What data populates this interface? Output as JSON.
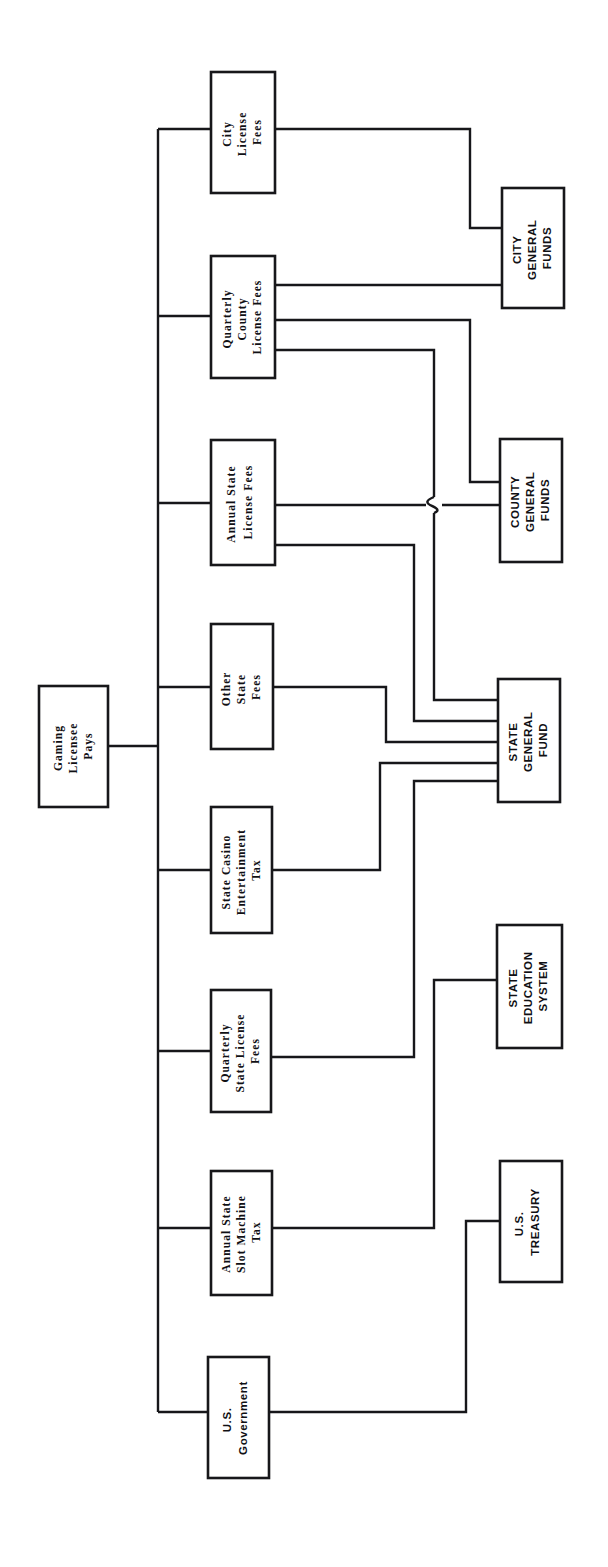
{
  "diagram": {
    "orientation": "rotated-90-clockwise",
    "background_color": "#ffffff",
    "line_color": "#17171a",
    "source_node": {
      "id": "gaming-licensee-pays",
      "label_lines": [
        "Gaming",
        "Licensee",
        "Pays"
      ]
    },
    "fee_nodes": [
      {
        "id": "city-license-fees",
        "label_lines": [
          "City",
          "License",
          "Fees"
        ]
      },
      {
        "id": "quarterly-county-license-fees",
        "label_lines": [
          "Quarterly",
          "County",
          "License  Fees"
        ]
      },
      {
        "id": "annual-state-license-fees",
        "label_lines": [
          "Annual  State",
          "License  Fees"
        ]
      },
      {
        "id": "other-state-fees",
        "label_lines": [
          "Other",
          "State",
          "Fees"
        ]
      },
      {
        "id": "state-casino-entertainment-tax",
        "label_lines": [
          "State  Casino",
          "Entertainment",
          "Tax"
        ]
      },
      {
        "id": "quarterly-state-license-fees",
        "label_lines": [
          "Quarterly",
          "State  License",
          "Fees"
        ]
      },
      {
        "id": "annual-state-slot-machine-tax",
        "label_lines": [
          "Annual  State",
          "Slot  Machine",
          "Tax"
        ]
      },
      {
        "id": "us-government",
        "label_lines": [
          "U.S.",
          "Government"
        ]
      }
    ],
    "destination_nodes": [
      {
        "id": "city-general-funds",
        "label_lines": [
          "CITY",
          "GENERAL",
          "FUNDS"
        ]
      },
      {
        "id": "county-general-funds",
        "label_lines": [
          "COUNTY",
          "GENERAL",
          "FUNDS"
        ]
      },
      {
        "id": "state-general-fund",
        "label_lines": [
          "STATE",
          "GENERAL",
          "FUND"
        ]
      },
      {
        "id": "state-education-system",
        "label_lines": [
          "STATE",
          "EDUCATION",
          "SYSTEM"
        ]
      },
      {
        "id": "us-treasury",
        "label_lines": [
          "U.S.",
          "TREASURY"
        ]
      }
    ],
    "flows": [
      {
        "from": "city-license-fees",
        "to": "city-general-funds"
      },
      {
        "from": "quarterly-county-license-fees",
        "to": "city-general-funds"
      },
      {
        "from": "quarterly-county-license-fees",
        "to": "county-general-funds"
      },
      {
        "from": "quarterly-county-license-fees",
        "to": "state-general-fund"
      },
      {
        "from": "annual-state-license-fees",
        "to": "county-general-funds"
      },
      {
        "from": "annual-state-license-fees",
        "to": "state-general-fund"
      },
      {
        "from": "other-state-fees",
        "to": "state-general-fund"
      },
      {
        "from": "state-casino-entertainment-tax",
        "to": "state-general-fund"
      },
      {
        "from": "quarterly-state-license-fees",
        "to": "state-general-fund"
      },
      {
        "from": "annual-state-slot-machine-tax",
        "to": "state-education-system"
      },
      {
        "from": "us-government",
        "to": "us-treasury"
      }
    ]
  }
}
